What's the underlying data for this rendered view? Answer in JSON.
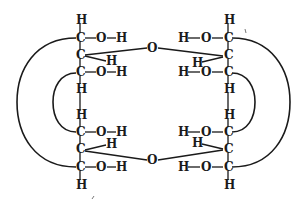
{
  "diagram": {
    "atom_symbols": {
      "carbon": "C",
      "hydrogen": "H",
      "oxygen": "O"
    },
    "left_chain": {
      "top_h": "H",
      "rows": [
        {
          "carbon": "C",
          "substituent": "O",
          "substituent_h": "H"
        },
        {
          "carbon": "C",
          "substituent_h": "H"
        },
        {
          "carbon": "C",
          "substituent": "O",
          "substituent_h": "H"
        },
        {
          "carbon": "C",
          "substituent": "O",
          "substituent_h": "H"
        },
        {
          "carbon": "C",
          "substituent_h": "H"
        },
        {
          "carbon": "C",
          "substituent": "O",
          "substituent_h": "H"
        }
      ],
      "mid_h_upper": "H",
      "mid_h_lower": "H",
      "bottom_h": "H"
    },
    "right_chain": {
      "top_h": "H",
      "rows": [
        {
          "carbon": "C",
          "substituent": "O",
          "substituent_h": "H"
        },
        {
          "carbon": "C",
          "substituent_h": "H"
        },
        {
          "carbon": "C",
          "substituent": "O",
          "substituent_h": "H"
        },
        {
          "carbon": "C",
          "substituent": "O",
          "substituent_h": "H"
        },
        {
          "carbon": "C",
          "substituent_h": "H"
        },
        {
          "carbon": "C",
          "substituent": "O",
          "substituent_h": "H"
        }
      ],
      "mid_h_upper": "H",
      "mid_h_lower": "H",
      "bottom_h": "H"
    },
    "bridges": {
      "top_oxygen": "O",
      "bottom_oxygen": "O"
    }
  }
}
